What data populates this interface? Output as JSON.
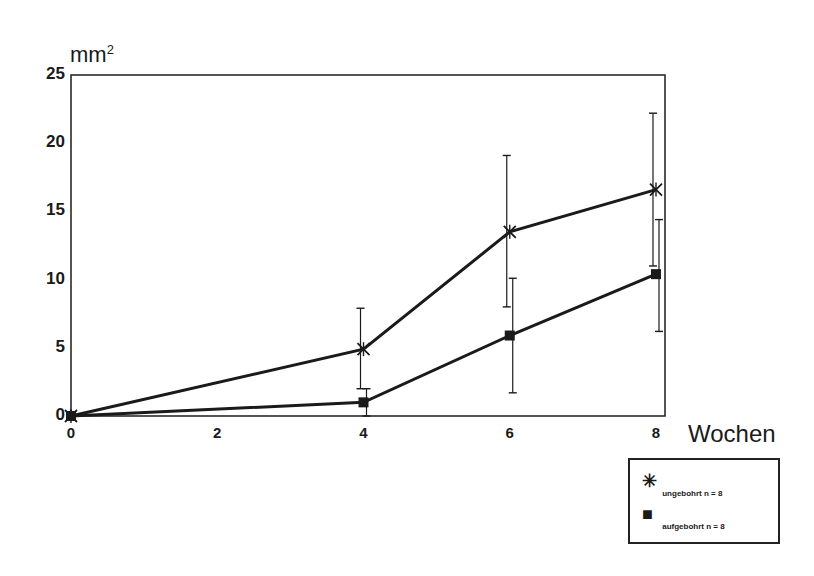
{
  "chart_data": {
    "type": "line",
    "title": "",
    "xlabel": "Wochen",
    "ylabel": "mm²",
    "ylabel_base": "mm",
    "ylabel_sup": "2",
    "x": [
      0,
      4,
      6,
      8
    ],
    "xticks": [
      "0",
      "2",
      "4",
      "6",
      "8"
    ],
    "yticks": [
      "0",
      "5",
      "10",
      "15",
      "20",
      "25"
    ],
    "xlim": [
      0,
      8
    ],
    "ylim": [
      0,
      25
    ],
    "grid": false,
    "legend_position": "bottom-right, outside plot",
    "series": [
      {
        "name": "ungebohrt n = 8",
        "marker": "asterisk",
        "values": [
          0,
          4.9,
          13.5,
          16.6
        ],
        "error_low": [
          0,
          2.0,
          8.0,
          11.0
        ],
        "error_high": [
          0,
          7.9,
          19.1,
          22.2
        ]
      },
      {
        "name": "aufgebohrt n = 8",
        "marker": "square",
        "values": [
          0,
          1.0,
          5.9,
          10.4
        ],
        "error_low": [
          0,
          0,
          1.7,
          6.2
        ],
        "error_high": [
          0,
          2.0,
          10.1,
          14.4
        ]
      }
    ]
  },
  "legend": {
    "items": [
      {
        "symbol": "✳",
        "label": "ungebohrt n = 8"
      },
      {
        "symbol": "■",
        "label": "aufgebohrt n = 8"
      }
    ]
  },
  "colors": {
    "line": "#1a1a1a",
    "background": "#ffffff"
  }
}
